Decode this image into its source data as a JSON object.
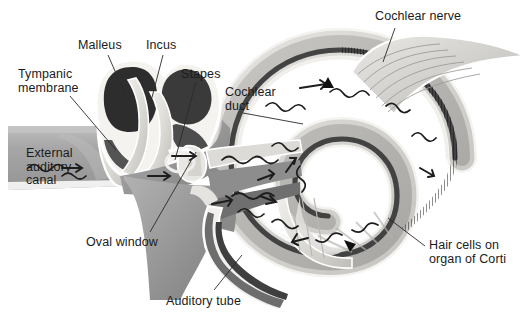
{
  "figure": {
    "type": "anatomical-illustration",
    "background_color": "#ffffff",
    "label_color": "#1b1b1b",
    "leader_line_color": "#2a2a2a"
  },
  "labels": [
    {
      "id": "tympanic-membrane",
      "text": "Tympanic\nmembrane",
      "x": 18,
      "y": 68,
      "align": "left"
    },
    {
      "id": "malleus",
      "text": "Malleus",
      "x": 78,
      "y": 39,
      "align": "left"
    },
    {
      "id": "incus",
      "text": "Incus",
      "x": 146,
      "y": 39,
      "align": "left"
    },
    {
      "id": "stapes",
      "text": "Stapes",
      "x": 181,
      "y": 68,
      "align": "left"
    },
    {
      "id": "cochlear-duct",
      "text": "Cochlear\nduct",
      "x": 225,
      "y": 86,
      "align": "left"
    },
    {
      "id": "cochlear-nerve",
      "text": "Cochlear nerve",
      "x": 375,
      "y": 10,
      "align": "left"
    },
    {
      "id": "external-auditory-canal",
      "text": "External\nauditory\ncanal",
      "x": 26,
      "y": 147,
      "align": "left"
    },
    {
      "id": "oval-window",
      "text": "Oval window",
      "x": 86,
      "y": 236,
      "align": "left"
    },
    {
      "id": "auditory-tube",
      "text": "Auditory tube",
      "x": 166,
      "y": 295,
      "align": "left"
    },
    {
      "id": "hair-cells-organ-of-corti",
      "text": "Hair cells on\norgan of Corti",
      "x": 429,
      "y": 239,
      "align": "left"
    }
  ],
  "leader_lines": [
    {
      "id": "leader-tympanic-membrane",
      "from": [
        70,
        96
      ],
      "to": [
        116,
        150
      ]
    },
    {
      "id": "leader-malleus",
      "from": [
        108,
        55
      ],
      "to": [
        128,
        101
      ]
    },
    {
      "id": "leader-incus",
      "from": [
        163,
        55
      ],
      "to": [
        150,
        105
      ]
    },
    {
      "id": "leader-stapes",
      "from": [
        196,
        82
      ],
      "to": [
        175,
        160
      ]
    },
    {
      "id": "leader-cochlear-duct",
      "from": [
        243,
        113
      ],
      "to": [
        303,
        124
      ]
    },
    {
      "id": "leader-cochlear-nerve",
      "from": [
        395,
        28
      ],
      "to": [
        383,
        62
      ]
    },
    {
      "id": "leader-oval-window",
      "from": [
        150,
        232
      ],
      "to": [
        196,
        152
      ]
    },
    {
      "id": "leader-auditory-tube",
      "from": [
        214,
        290
      ],
      "to": [
        242,
        255
      ]
    },
    {
      "id": "leader-hair-cells",
      "from": [
        425,
        246
      ],
      "to": [
        388,
        218
      ]
    }
  ],
  "structures": [
    {
      "id": "external-auditory-canal-block",
      "name": "external auditory canal"
    },
    {
      "id": "tympanic-membrane-shape",
      "name": "tympanic membrane (eardrum)"
    },
    {
      "id": "malleus-bone",
      "name": "malleus"
    },
    {
      "id": "incus-bone",
      "name": "incus"
    },
    {
      "id": "stapes-bone",
      "name": "stapes"
    },
    {
      "id": "oval-window-shape",
      "name": "oval window"
    },
    {
      "id": "auditory-tube-shape",
      "name": "auditory tube"
    },
    {
      "id": "cochlea-spiral",
      "name": "cochlea"
    },
    {
      "id": "cochlear-duct-band",
      "name": "cochlear duct"
    },
    {
      "id": "organ-of-corti-band",
      "name": "organ of Corti hair cells"
    },
    {
      "id": "cochlear-nerve-bundle",
      "name": "cochlear nerve"
    }
  ],
  "palette": {
    "canal_gray": "#a9a9a9",
    "canal_dark": "#8f8f8f",
    "bone_light": "#e6e4e0",
    "tissue_mid": "#9e9e9e",
    "tissue_dark": "#6b6b6b",
    "ossicle_black": "#2e2e2e",
    "duct_dark": "#3a3a3a",
    "spiral_light": "#d8d7d4",
    "spiral_mid": "#b0afac",
    "outline": "#f2f1ee"
  },
  "sound_wave_arrows": {
    "description": "wavy arrows indicating sound wave / fluid wave propagation",
    "count": 12,
    "color": "#1d1d1d"
  }
}
